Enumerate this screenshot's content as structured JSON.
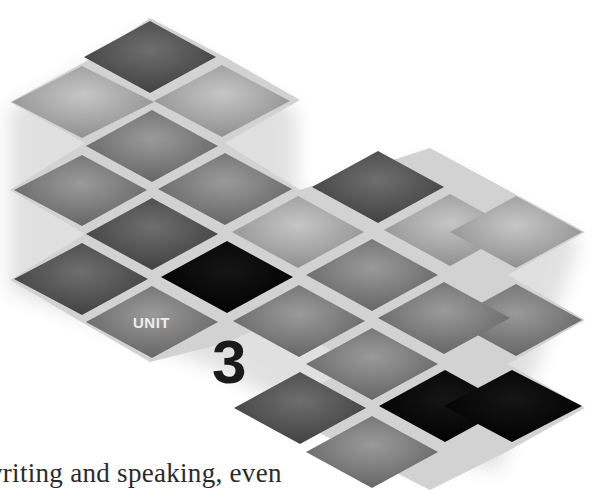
{
  "header": {
    "unit_label": "UNIT",
    "unit_number": "3"
  },
  "body": {
    "text_fragment": "vriting and speaking, even"
  },
  "decoration": {
    "tile_colors": {
      "black": "#0a0a0a",
      "dark": "#5a5a5a",
      "medium": "#858585",
      "light": "#b4b4b4",
      "gap": "#d2d2d2"
    }
  }
}
